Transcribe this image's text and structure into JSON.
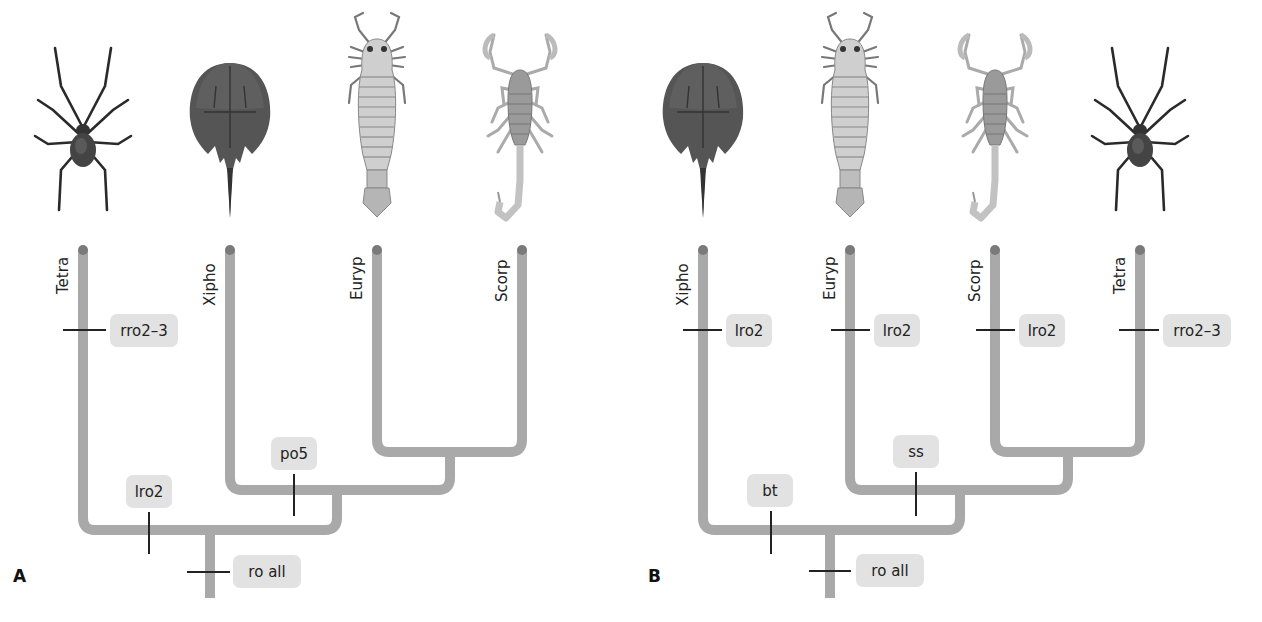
{
  "panels": [
    {
      "id": "A",
      "label": "A",
      "taxa": [
        "Tetra",
        "Xipho",
        "Euryp",
        "Scorp"
      ],
      "organisms": [
        "spider",
        "horseshoe-crab",
        "eurypterid",
        "scorpion"
      ],
      "characters": {
        "tip_tetra": "rro2–3",
        "node_xipho_euryp_scorp": "po5",
        "node_tetra_branch": "lro2",
        "root": "ro all"
      }
    },
    {
      "id": "B",
      "label": "B",
      "taxa": [
        "Xipho",
        "Euryp",
        "Scorp",
        "Tetra"
      ],
      "organisms": [
        "horseshoe-crab",
        "eurypterid",
        "scorpion",
        "spider"
      ],
      "characters": {
        "tip_xipho": "lro2",
        "tip_euryp": "lro2",
        "tip_scorp": "lro2",
        "tip_tetra": "rro2–3",
        "node_euryp_scorp_tetra": "ss",
        "node_xipho_branch": "bt",
        "root": "ro all"
      }
    }
  ],
  "colors": {
    "branch": "#a9a9a9",
    "tip_dot": "#7a7a7a",
    "label_box": "#e2e2e2",
    "tick": "#222222"
  }
}
